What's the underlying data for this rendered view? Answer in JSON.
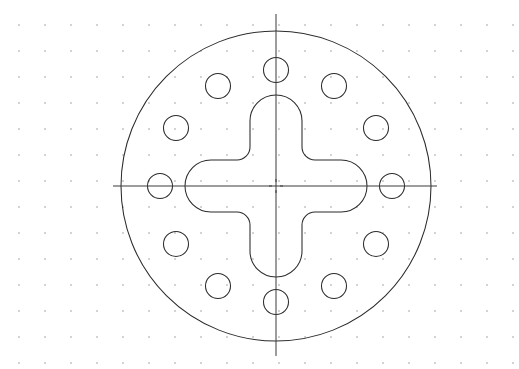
{
  "document": {
    "type": "engineering-drawing",
    "view": "front-view-circular-plate",
    "canvas_width": 519,
    "canvas_height": 369,
    "background_color": "#ffffff",
    "line_color": "#2b2b2b",
    "centerline_color": "#3a3a3a",
    "grid_dot_color": "#9a9aa5"
  },
  "grid": {
    "visible": true,
    "style": "dot-grid",
    "spacing_px": 26,
    "origin_x": 19,
    "origin_y": 25,
    "dot_radius_px": 0.8,
    "columns": 20,
    "rows": 14
  },
  "geometry": {
    "center_x": 276,
    "center_y": 186,
    "outer_circle": {
      "name": "plate-outer-diameter",
      "radius": 155,
      "diameter": 310
    },
    "bolt_circle": {
      "name": "bolt-hole-circle",
      "radius": 116,
      "hole_count": 12,
      "hole_radius": 12.5,
      "hole_diameter": 25,
      "angle_step_deg": 30,
      "start_angle_deg": -90,
      "holes": [
        {
          "index": 1,
          "angle_deg": -90,
          "cx": 276,
          "cy": 70
        },
        {
          "index": 2,
          "angle_deg": -60,
          "cx": 334,
          "cy": 86
        },
        {
          "index": 3,
          "angle_deg": -30,
          "cx": 376,
          "cy": 128
        },
        {
          "index": 4,
          "angle_deg": 0,
          "cx": 392,
          "cy": 186
        },
        {
          "index": 5,
          "angle_deg": 30,
          "cx": 376,
          "cy": 244
        },
        {
          "index": 6,
          "angle_deg": 60,
          "cx": 334,
          "cy": 286
        },
        {
          "index": 7,
          "angle_deg": 90,
          "cx": 276,
          "cy": 302
        },
        {
          "index": 8,
          "angle_deg": 120,
          "cx": 218,
          "cy": 286
        },
        {
          "index": 9,
          "angle_deg": 150,
          "cx": 176,
          "cy": 244
        },
        {
          "index": 10,
          "angle_deg": 180,
          "cx": 160,
          "cy": 186
        },
        {
          "index": 11,
          "angle_deg": 210,
          "cx": 176,
          "cy": 128
        },
        {
          "index": 12,
          "angle_deg": 240,
          "cx": 218,
          "cy": 86
        }
      ]
    },
    "cross_cutout": {
      "name": "plus-shaped-slot",
      "arm_half_width": 26,
      "arm_reach": 91,
      "end_corner_radius": 26,
      "inner_corner_radius": 13,
      "arm_count": 4
    },
    "centerlines": {
      "horizontal": {
        "x1": 113,
        "y1": 186,
        "x2": 437,
        "y2": 186
      },
      "vertical": {
        "x1": 276,
        "y1": 14,
        "x2": 276,
        "y2": 356
      },
      "dash_pattern": "solid-with-center-break"
    }
  },
  "labels": {
    "title": "",
    "annotations": [],
    "dimensions": []
  }
}
